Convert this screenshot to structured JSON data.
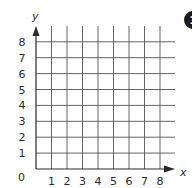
{
  "figure": {
    "type": "coordinate-grid",
    "x_axis_label": "x",
    "y_axis_label": "y",
    "origin_label": "0",
    "x_ticks": [
      "1",
      "2",
      "3",
      "4",
      "5",
      "6",
      "7",
      "8"
    ],
    "y_ticks": [
      "1",
      "2",
      "3",
      "4",
      "5",
      "6",
      "7",
      "8"
    ],
    "badge": "1"
  },
  "chart_data": {
    "type": "scatter",
    "title": "",
    "xlabel": "x",
    "ylabel": "y",
    "xlim": [
      0,
      8
    ],
    "ylim": [
      0,
      8
    ],
    "x_ticks": [
      1,
      2,
      3,
      4,
      5,
      6,
      7,
      8
    ],
    "y_ticks": [
      1,
      2,
      3,
      4,
      5,
      6,
      7,
      8
    ],
    "grid": true,
    "series": []
  },
  "colors": {
    "grid": "#555555",
    "axis": "#2a2a2a",
    "text": "#2a2a2a",
    "badge": "#1a1a1a"
  }
}
